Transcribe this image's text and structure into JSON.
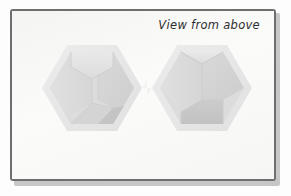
{
  "page": {
    "background_color": "#fdfdfd",
    "frame": {
      "border_color": "#6e6e6e",
      "fill_color": "#f7f7f6",
      "shadow_color": "#9a9a9a"
    }
  },
  "annotation": {
    "label": "View from above"
  },
  "artwork": {
    "description": "two hexagonal isometric cube forms seen from above",
    "palette": {
      "hex_outer": "#e7e7e7",
      "face_top": "#e2e2e2",
      "face_left": "#dedede",
      "face_right": "#d4d4d4",
      "face_floor": "#c8c8c8",
      "edge": "#cfcfcf"
    },
    "shapes": [
      {
        "name": "left-hexagon",
        "center_x": 85,
        "center_y": 96,
        "radius": 56,
        "interior": "stepped-notch cube corner"
      },
      {
        "name": "right-hexagon",
        "center_x": 195,
        "center_y": 96,
        "radius": 56,
        "interior": "open cube corner"
      }
    ]
  }
}
